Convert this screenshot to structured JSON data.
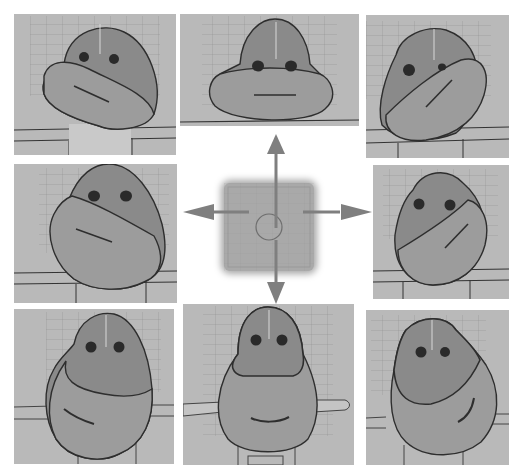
{
  "figure": {
    "colors": {
      "viewport_bg": "#b9b9b9",
      "head_fill": "#8a8a8a",
      "jaw_fill": "#9c9c9c",
      "outline": "#2e2e2e",
      "grid_line": "#8f8f8f",
      "arrow": "#808080",
      "pad_bg": "#a9a9a9"
    },
    "panels": [
      {
        "position": "top-left",
        "pose": "jaw up-left"
      },
      {
        "position": "top-center",
        "pose": "jaw up"
      },
      {
        "position": "top-right",
        "pose": "jaw up-right"
      },
      {
        "position": "middle-left",
        "pose": "jaw left"
      },
      {
        "position": "middle-right",
        "pose": "jaw right"
      },
      {
        "position": "bottom-left",
        "pose": "jaw down-left"
      },
      {
        "position": "bottom-center",
        "pose": "jaw down"
      },
      {
        "position": "bottom-right",
        "pose": "jaw down-right"
      }
    ],
    "control_pad": {
      "shape": "square with center circle",
      "arrows": [
        "up",
        "down",
        "left",
        "right"
      ]
    }
  }
}
